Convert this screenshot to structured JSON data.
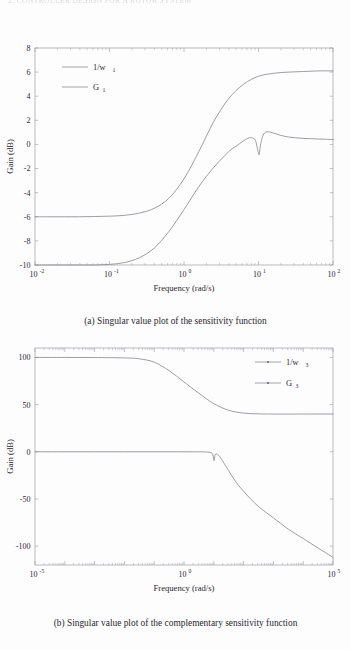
{
  "page": {
    "running_header": "2. CONTROLLER DESIGN FOR A ROTOR SYSTEM"
  },
  "figures": [
    {
      "id": "a",
      "caption": "(a) Singular value plot of the sensitivity function",
      "xlabel": "Frequency (rad/s)",
      "ylabel": "Gain (dB)",
      "xticklabels": [
        "10",
        "10",
        "10",
        "10",
        "10"
      ],
      "xtickexp": [
        "-2",
        "-1",
        "0",
        "1",
        "2"
      ],
      "yticklabels": [
        "8",
        "6",
        "4",
        "2",
        "0",
        "-2",
        "-4",
        "-6",
        "-8",
        "-10"
      ],
      "legend": [
        {
          "label": "1/w",
          "sub": "1",
          "marker": false
        },
        {
          "label": "G",
          "sub": "1",
          "marker": false
        }
      ]
    },
    {
      "id": "b",
      "caption": "(b) Singular value plot of the complementary sensitivity function",
      "xlabel": "Frequency (rad/s)",
      "ylabel": "Gain (dB)",
      "xticklabels": [
        "10",
        "10",
        "10"
      ],
      "xtickexp": [
        "-5",
        "0",
        "5"
      ],
      "yticklabels": [
        "100",
        "50",
        "0",
        "-50",
        "-100"
      ],
      "legend": [
        {
          "label": "1/w",
          "sub": "3",
          "marker": true
        },
        {
          "label": "G",
          "sub": "3",
          "marker": true
        }
      ]
    }
  ],
  "colors": {
    "curve": "#8e8b93",
    "axis": "#9d9aa2",
    "text": "#2a2730",
    "background": "#fdfdfd"
  },
  "chart_data": [
    {
      "type": "line",
      "title": "",
      "xlabel": "Frequency (rad/s)",
      "ylabel": "Gain (dB)",
      "xscale": "log",
      "xlim": [
        0.01,
        100
      ],
      "ylim": [
        -10,
        8
      ],
      "yticks": [
        8,
        6,
        4,
        2,
        0,
        -2,
        -4,
        -6,
        -8,
        -10
      ],
      "xticks": [
        0.01,
        0.1,
        1,
        10,
        100
      ],
      "grid": false,
      "legend_position": "upper-left",
      "series": [
        {
          "name": "1/w_1",
          "x": [
            0.01,
            0.0158,
            0.0251,
            0.0398,
            0.0631,
            0.1,
            0.158,
            0.251,
            0.398,
            0.631,
            1.0,
            1.58,
            2.51,
            3.98,
            6.31,
            10.0,
            15.8,
            25.1,
            39.8,
            63.1,
            100.0
          ],
          "y": [
            -6.0,
            -6.0,
            -6.0,
            -6.0,
            -5.98,
            -5.95,
            -5.88,
            -5.7,
            -5.3,
            -4.45,
            -2.85,
            -0.6,
            1.9,
            3.8,
            5.0,
            5.65,
            5.9,
            6.0,
            6.05,
            6.1,
            6.1
          ]
        },
        {
          "name": "G_1",
          "x": [
            0.01,
            0.0158,
            0.0251,
            0.0398,
            0.0631,
            0.1,
            0.158,
            0.251,
            0.398,
            0.631,
            1.0,
            1.58,
            2.51,
            3.98,
            5.0,
            6.31,
            7.5,
            8.5,
            9.2,
            9.8,
            10.2,
            10.6,
            11.2,
            12.0,
            13.5,
            15.8,
            20.0,
            25.1,
            31.6,
            39.8,
            50.1,
            63.1,
            79.4,
            100.0
          ],
          "y": [
            -10.0,
            -10.0,
            -10.0,
            -10.0,
            -10.0,
            -9.95,
            -9.8,
            -9.4,
            -8.6,
            -7.2,
            -5.4,
            -3.5,
            -1.9,
            -0.6,
            -0.15,
            0.3,
            0.55,
            0.52,
            0.25,
            -0.5,
            -0.85,
            -0.1,
            0.55,
            0.95,
            1.05,
            0.95,
            0.75,
            0.62,
            0.55,
            0.5,
            0.48,
            0.45,
            0.43,
            0.4
          ]
        }
      ]
    },
    {
      "type": "line",
      "title": "",
      "xlabel": "Frequency (rad/s)",
      "ylabel": "Gain (dB)",
      "xscale": "log",
      "xlim": [
        1e-05,
        100000.0
      ],
      "ylim": [
        -120,
        110
      ],
      "yticks": [
        100,
        50,
        0,
        -50,
        -100
      ],
      "xticks": [
        1e-05,
        1,
        100000
      ],
      "grid": false,
      "legend_position": "upper-right",
      "series": [
        {
          "name": "1/w_3",
          "x": [
            1e-05,
            0.0001,
            0.001,
            0.01,
            0.0316,
            0.1,
            0.316,
            1.0,
            3.16,
            10.0,
            31.6,
            100.0,
            316.0,
            1000.0,
            10000.0,
            100000.0
          ],
          "y": [
            100.0,
            100.0,
            99.9,
            99.5,
            98.5,
            95.0,
            86.0,
            74.0,
            62.0,
            51.0,
            44.0,
            41.0,
            40.2,
            40.0,
            40.0,
            40.0
          ]
        },
        {
          "name": "G_3",
          "x": [
            1e-05,
            0.0001,
            0.001,
            0.01,
            0.1,
            1.0,
            3.16,
            6.31,
            8.5,
            9.5,
            10.2,
            11.0,
            12.5,
            15.8,
            20.0,
            31.6,
            50.1,
            100.0,
            316.0,
            1000.0,
            3160.0,
            10000.0,
            31600.0,
            100000.0
          ],
          "y": [
            0.0,
            0.0,
            0.0,
            0.0,
            0.0,
            0.0,
            -0.05,
            -0.3,
            -1.2,
            -4.5,
            -9.5,
            -3.5,
            -2.2,
            -5.0,
            -10.0,
            -20.0,
            -30.0,
            -42.0,
            -58.0,
            -70.0,
            -82.0,
            -92.0,
            -102.0,
            -112.0
          ]
        }
      ]
    }
  ]
}
